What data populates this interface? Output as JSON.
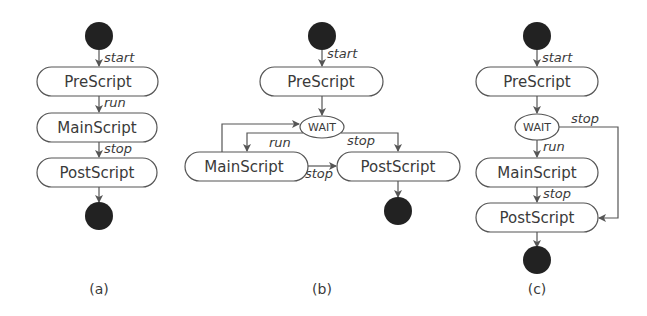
{
  "panels": [
    {
      "id": "a",
      "caption": "(a)",
      "nodes": {
        "pre": "PreScript",
        "main": "MainScript",
        "post": "PostScript"
      },
      "edges": {
        "start": "start",
        "run": "run",
        "stop": "stop"
      }
    },
    {
      "id": "b",
      "caption": "(b)",
      "nodes": {
        "pre": "PreScript",
        "wait": "WAIT",
        "main": "MainScript",
        "post": "PostScript"
      },
      "edges": {
        "start": "start",
        "run": "run",
        "stop_wait": "stop",
        "stop_main": "stop"
      }
    },
    {
      "id": "c",
      "caption": "(c)",
      "nodes": {
        "pre": "PreScript",
        "wait": "WAIT",
        "main": "MainScript",
        "post": "PostScript"
      },
      "edges": {
        "start": "start",
        "run": "run",
        "stop_wait": "stop",
        "stop_main": "stop"
      }
    }
  ],
  "colors": {
    "stroke": "#555555",
    "dot": "#222222",
    "text": "#3a3a3a",
    "background": "#ffffff"
  }
}
